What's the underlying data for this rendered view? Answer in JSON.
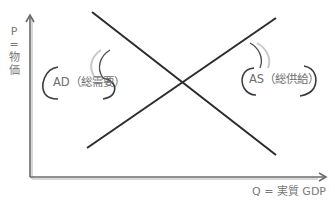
{
  "diagram": {
    "y_axis": {
      "label_lines": [
        "P",
        "=",
        "物",
        "価"
      ]
    },
    "x_axis": {
      "label": "Q = 実質 GDP"
    },
    "curves": [
      {
        "name": "AD",
        "label": "AD（総需要）",
        "from": [
          92,
          12
        ],
        "to": [
          276,
          155
        ]
      },
      {
        "name": "AS",
        "label": "AS（総供給）",
        "from": [
          87,
          148
        ],
        "to": [
          276,
          18
        ]
      }
    ],
    "colors": {
      "line": "#2b2b2b",
      "axis": "#6a6a6a",
      "bracket": "#4a4a4a",
      "shadow": "#c8c8c8",
      "text": "#7a7a7a"
    }
  }
}
